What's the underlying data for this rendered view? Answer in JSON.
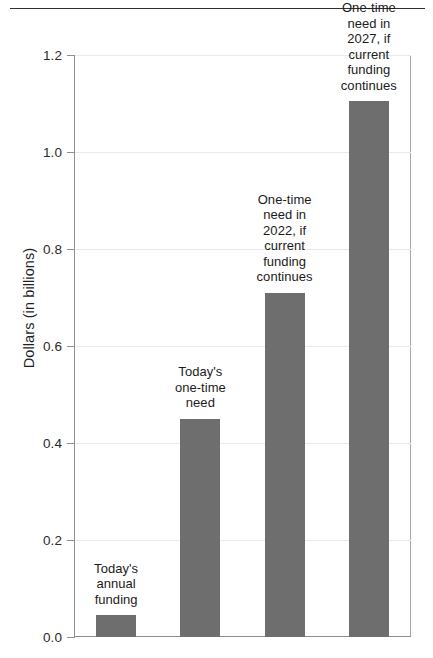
{
  "top_rule": {
    "cutoff_text_fragment": "",
    "present": true
  },
  "chart_data": {
    "type": "bar",
    "title": "",
    "subtitle": "",
    "xlabel": "",
    "ylabel": "Dollars (in billions)",
    "ylim": [
      0.0,
      1.2
    ],
    "ytick_labels": [
      "0.0",
      "0.2",
      "0.4",
      "0.6",
      "0.8",
      "1.0",
      "1.2"
    ],
    "ytick_values": [
      0.0,
      0.2,
      0.4,
      0.6,
      0.8,
      1.0,
      1.2
    ],
    "grid": true,
    "grid_axis": "y",
    "legend": "none",
    "bar_color": "#6e6e6e",
    "categories": [
      "Today's annual funding",
      "Today's one-time need",
      "One-time need in 2022, if current funding continues",
      "One-time need in 2027, if current funding continues"
    ],
    "values": [
      0.045,
      0.45,
      0.71,
      1.105
    ],
    "labels": [
      "Today's\nannual\nfunding",
      "Today's\none-time\nneed",
      "One-time\nneed in\n2022, if\ncurrent\nfunding\ncontinues",
      "One-time\nneed in\n2027, if\ncurrent\nfunding\ncontinues"
    ],
    "label_position": "above-bar"
  }
}
